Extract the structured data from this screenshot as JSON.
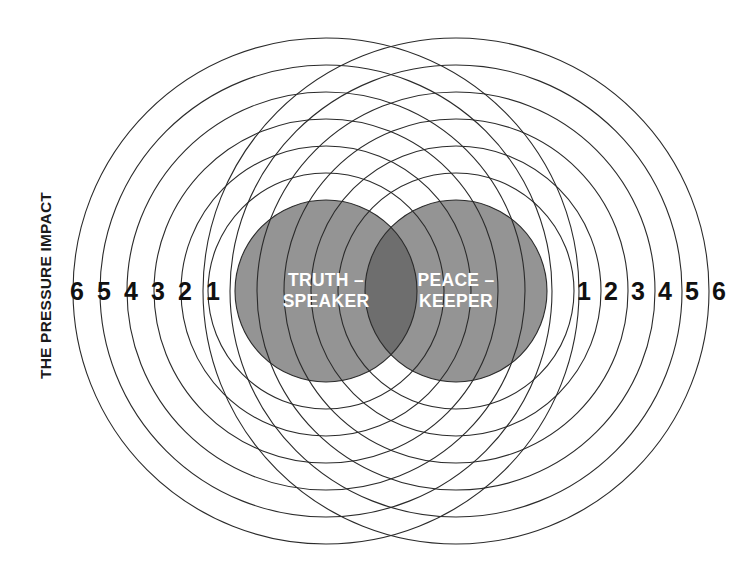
{
  "diagram": {
    "axis_label": "THE PRESSURE IMPACT",
    "left_circle": {
      "line1": "TRUTH –",
      "line2": "SPEAKER",
      "cx": 326,
      "cy": 291,
      "r": 91,
      "fill": "#949494",
      "text_color": "#ffffff"
    },
    "right_circle": {
      "line1": "PEACE –",
      "line2": "KEEPER",
      "cx": 456,
      "cy": 291,
      "r": 91,
      "fill": "#949494",
      "text_color": "#ffffff"
    },
    "overlap_fill": "#6e6e6e",
    "ring_color": "#2b2b2b",
    "ring_width": 1.1,
    "ring_count": 6,
    "ring_step": 27,
    "background": "#ffffff",
    "left_scale": {
      "labels": [
        "6",
        "5",
        "4",
        "3",
        "2",
        "1"
      ],
      "positions": [
        77,
        104,
        131,
        158,
        185,
        213
      ],
      "y": 291
    },
    "right_scale": {
      "labels": [
        "1",
        "2",
        "3",
        "4",
        "5",
        "6"
      ],
      "positions": [
        584,
        611,
        638,
        665,
        692,
        719
      ],
      "y": 291
    }
  },
  "chart_data": {
    "type": "diagram",
    "title": "The Pressure Impact",
    "xlabel": "",
    "ylabel": "THE PRESSURE IMPACT",
    "categories": [
      "TRUTH – SPEAKER",
      "PEACE – KEEPER"
    ],
    "left_axis_ticks": [
      6,
      5,
      4,
      3,
      2,
      1
    ],
    "right_axis_ticks": [
      1,
      2,
      3,
      4,
      5,
      6
    ],
    "rings_per_side": 6,
    "legend": []
  }
}
